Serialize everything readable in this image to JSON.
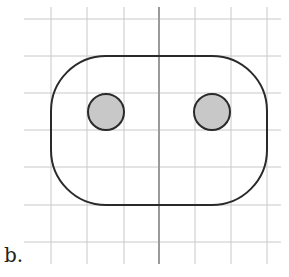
{
  "figure": {
    "label": "b.",
    "grid": {
      "color": "#c8c8c8",
      "x_lines": [
        51,
        87,
        124,
        195,
        231,
        267
      ],
      "y_lines": [
        19,
        56,
        93,
        130,
        167,
        205,
        242
      ],
      "x_extent": [
        24,
        281
      ],
      "y_extent": [
        7,
        264
      ]
    },
    "axis": {
      "x": 159,
      "color": "#9a9a9a"
    },
    "rounded_shape": {
      "x": 51,
      "y": 56,
      "width": 216,
      "height": 149,
      "radius": 55,
      "stroke": "#2a2a2a"
    },
    "circles": [
      {
        "cx": 106,
        "cy": 112,
        "r": 18,
        "fill": "#c8c8c8",
        "stroke": "#2a2a2a"
      },
      {
        "cx": 212,
        "cy": 112,
        "r": 18,
        "fill": "#c8c8c8",
        "stroke": "#2a2a2a"
      }
    ]
  }
}
